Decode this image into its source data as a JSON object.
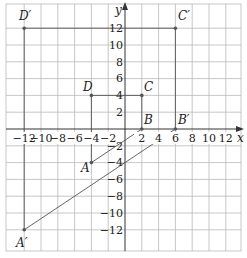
{
  "figure": {
    "title": "",
    "x_axis_label": "x",
    "y_axis_label": "y",
    "x_ticks": [
      "−12",
      "−10",
      "−8",
      "−6",
      "−4",
      "−2",
      "2",
      "4",
      "6",
      "8",
      "10",
      "12"
    ],
    "y_ticks": [
      "12",
      "10",
      "8",
      "6",
      "4",
      "2",
      "−2",
      "−4",
      "−6",
      "−8",
      "−10",
      "−12"
    ],
    "points": {
      "A": {
        "label": "A",
        "x": -4,
        "y": -4
      },
      "B": {
        "label": "B",
        "x": 2,
        "y": 0
      },
      "C": {
        "label": "C",
        "x": 2,
        "y": 4
      },
      "D": {
        "label": "D",
        "x": -4,
        "y": 4
      },
      "A_prime": {
        "label": "A′",
        "x": -12,
        "y": -12
      },
      "B_prime": {
        "label": "B′",
        "x": 6,
        "y": 0
      },
      "C_prime": {
        "label": "C′",
        "x": 6,
        "y": 12
      },
      "D_prime": {
        "label": "D′",
        "x": -12,
        "y": 12
      }
    },
    "colors": {
      "grid": "#b9b9b9",
      "axis": "#333333",
      "shape": "#555555"
    }
  }
}
